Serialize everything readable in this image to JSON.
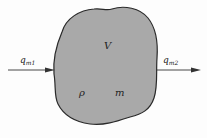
{
  "diagram": {
    "volume_label": "V",
    "density_label": "ρ",
    "mass_label": "m",
    "inflow": {
      "symbol": "q",
      "subscript": "m1"
    },
    "outflow": {
      "symbol": "q",
      "subscript": "m2"
    },
    "colors": {
      "fill": "#a9a9a9",
      "stroke": "#2a2a2a",
      "arrow": "#333333"
    }
  }
}
